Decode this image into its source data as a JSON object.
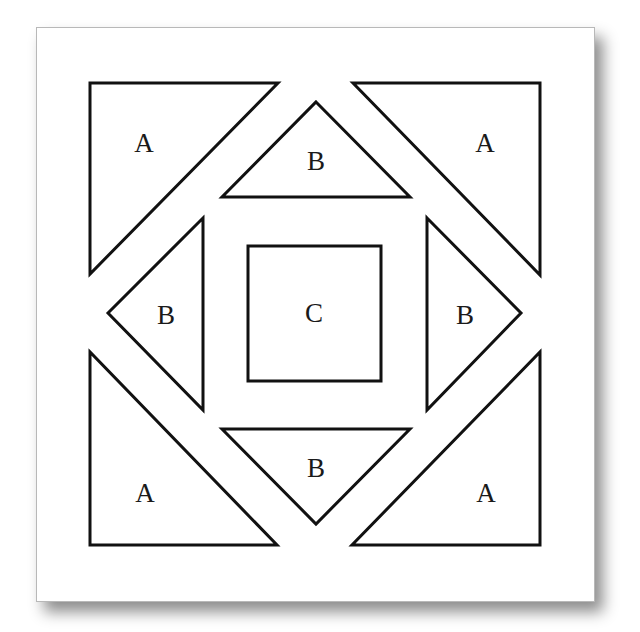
{
  "diagram": {
    "stroke_color": "#111111",
    "pieces": [
      {
        "id": "a-top-left",
        "label": "A",
        "shape": "triangle",
        "points": "90,83 278,83 90,274",
        "label_x": 144,
        "label_y": 143
      },
      {
        "id": "a-top-right",
        "label": "A",
        "shape": "triangle",
        "points": "353,83 540,83 540,275",
        "label_x": 485,
        "label_y": 143
      },
      {
        "id": "b-top",
        "label": "B",
        "shape": "triangle",
        "points": "316,102 410,197 222,197",
        "label_x": 316,
        "label_y": 161
      },
      {
        "id": "b-left",
        "label": "B",
        "shape": "triangle",
        "points": "108,313 203,218 203,410",
        "label_x": 166,
        "label_y": 315
      },
      {
        "id": "c-center",
        "label": "C",
        "shape": "square",
        "points": "248,246 381,246 381,381 248,381",
        "label_x": 314,
        "label_y": 313
      },
      {
        "id": "b-right",
        "label": "B",
        "shape": "triangle",
        "points": "427,218 521,313 427,410",
        "label_x": 465,
        "label_y": 315
      },
      {
        "id": "b-bottom",
        "label": "B",
        "shape": "triangle",
        "points": "222,429 410,429 316,524",
        "label_x": 316,
        "label_y": 468
      },
      {
        "id": "a-bottom-left",
        "label": "A",
        "shape": "triangle",
        "points": "90,352 90,545 277,545",
        "label_x": 145,
        "label_y": 493
      },
      {
        "id": "a-bottom-right",
        "label": "A",
        "shape": "triangle",
        "points": "540,352 540,545 352,545",
        "label_x": 486,
        "label_y": 493
      }
    ]
  }
}
